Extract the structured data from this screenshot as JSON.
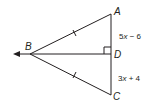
{
  "diagram": {
    "type": "geometry",
    "points": {
      "A": {
        "label": "A",
        "x": 111,
        "y": 14
      },
      "B": {
        "label": "B",
        "x": 30,
        "y": 54
      },
      "C": {
        "label": "C",
        "x": 111,
        "y": 95
      },
      "D": {
        "label": "D",
        "x": 111,
        "y": 54
      }
    },
    "segments": [
      {
        "from": "B",
        "to": "A",
        "tick_marks": 1
      },
      {
        "from": "B",
        "to": "C",
        "tick_marks": 1
      },
      {
        "from": "A",
        "to": "C"
      },
      {
        "from": "D",
        "to": "B",
        "ray": true,
        "note": "ray extends left past B"
      }
    ],
    "right_angle_at": "D",
    "measures": {
      "AD": "5x − 6",
      "DC": "3x + 4"
    },
    "expr_ad": {
      "coef": "5",
      "var": "x",
      "rest": " − 6"
    },
    "expr_dc": {
      "coef": "3",
      "var": "x",
      "rest": " + 4"
    },
    "color": "#231f20"
  }
}
